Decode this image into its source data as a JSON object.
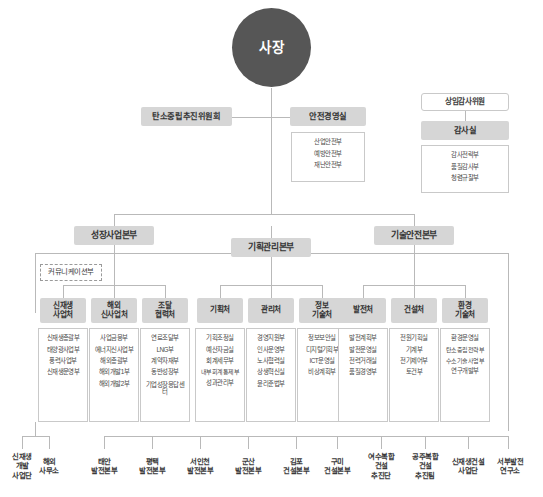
{
  "meta": {
    "colors": {
      "ceo_fill": "#565656",
      "chip_fill": "#d6d6d6",
      "line": "#b9b9b9",
      "box_border": "#c9c9c9",
      "text": "#3c3c3c"
    }
  },
  "ceo": {
    "label": "사장"
  },
  "committees": {
    "carbon": {
      "label": "탄소중립추진위원회"
    },
    "safety": {
      "label": "안전경영실",
      "items": [
        "산업안전부",
        "예방안전부",
        "재난안전부"
      ]
    }
  },
  "audit": {
    "standing_auditor": {
      "label": "상임감사위원"
    },
    "office": {
      "label": "감사실"
    },
    "items": [
      "감사전략부",
      "품질감사부",
      "청렴규찰부"
    ]
  },
  "divisions": [
    {
      "label": "성장사업본부"
    },
    {
      "label": "기획관리본부"
    },
    {
      "label": "기술안전본부"
    }
  ],
  "communications": {
    "label": "커뮤니케이션부"
  },
  "departments": [
    {
      "label": "신재생\n사업처",
      "label_lines": [
        "신재생",
        "사업처"
      ],
      "items": [
        "신재생총괄부",
        "태양광사업부",
        "풍력사업부",
        "신재생운영부"
      ]
    },
    {
      "label": "해외\n신사업처",
      "label_lines": [
        "해외",
        "신사업처"
      ],
      "items": [
        "사업금융부",
        "에너지신사업부",
        "해외총괄부",
        "해외개발1부",
        "해외개발2부"
      ]
    },
    {
      "label": "조달\n협력처",
      "label_lines": [
        "조달",
        "협력처"
      ],
      "items": [
        "연료조달부",
        "LNG부",
        "계약자재부",
        "동반성장부",
        "기업성장응답센터"
      ]
    },
    {
      "label": "기획처",
      "label_lines": [
        "기획처"
      ],
      "items": [
        "기획조정실",
        "예산자금실",
        "회계세무부",
        "내부회계통제부",
        "성과관리부"
      ]
    },
    {
      "label": "관리처",
      "label_lines": [
        "관리처"
      ],
      "items": [
        "경영지원부",
        "인사운영부",
        "노사협력실",
        "상생혁신실",
        "윤리준법부"
      ]
    },
    {
      "label": "정보\n기술처",
      "label_lines": [
        "정보",
        "기술처"
      ],
      "items": [
        "정보보안실",
        "디지털기획부",
        "ICT운영실",
        "비상계획부"
      ]
    },
    {
      "label": "발전처",
      "label_lines": [
        "발전처"
      ],
      "items": [
        "발전계획부",
        "발전운영실",
        "전력거래실",
        "품질경영부"
      ]
    },
    {
      "label": "건설처",
      "label_lines": [
        "건설처"
      ],
      "items": [
        "전원기획실",
        "기계부",
        "전기제어부",
        "토건부"
      ]
    },
    {
      "label": "환경\n기술처",
      "label_lines": [
        "환경",
        "기술처"
      ],
      "items": [
        "환경운영실",
        "탄소중립전략부",
        "수소기술사업부",
        "연구개발부"
      ]
    }
  ],
  "field_units": [
    {
      "lines": [
        "신재생",
        "개발",
        "사업단"
      ]
    },
    {
      "lines": [
        "해외",
        "사무소"
      ]
    },
    {
      "lines": [
        "태안",
        "발전본부"
      ]
    },
    {
      "lines": [
        "평택",
        "발전본부"
      ]
    },
    {
      "lines": [
        "서인천",
        "발전본부"
      ]
    },
    {
      "lines": [
        "군산",
        "발전본부"
      ]
    },
    {
      "lines": [
        "김포",
        "건설본부"
      ]
    },
    {
      "lines": [
        "구미",
        "건설본부"
      ]
    },
    {
      "lines": [
        "여수복합",
        "건설",
        "추진단"
      ]
    },
    {
      "lines": [
        "공주복합",
        "건설",
        "추진팀"
      ]
    },
    {
      "lines": [
        "신재생건설",
        "사업단"
      ]
    },
    {
      "lines": [
        "서부발전",
        "연구소"
      ]
    }
  ]
}
